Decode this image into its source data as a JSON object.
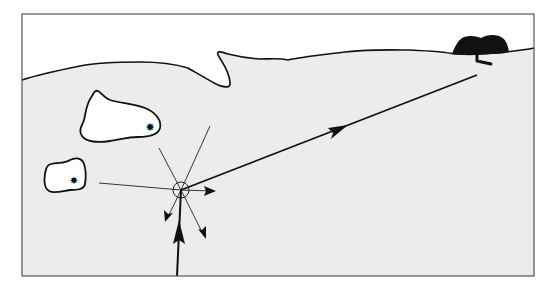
{
  "diagram": {
    "type": "schematic map",
    "colors": {
      "sea": "#ececec",
      "land": "#ffffff",
      "outline": "#111111",
      "frame": "#555555",
      "landmark": "#111111"
    },
    "elements": [
      {
        "id": "frame",
        "label": "map frame"
      },
      {
        "id": "coastline",
        "label": "coastline"
      },
      {
        "id": "island-large",
        "label": "large island",
        "marker": "star"
      },
      {
        "id": "island-small",
        "label": "small island",
        "marker": "star"
      },
      {
        "id": "origin",
        "label": "circled origin point"
      },
      {
        "id": "approach-path",
        "label": "incoming path arrow (bold, from bottom)"
      },
      {
        "id": "search-rays",
        "label": "radiating direction rays (thin)"
      },
      {
        "id": "route",
        "label": "bold route to landmark with arrowhead"
      },
      {
        "id": "landmark",
        "label": "dark landmark on shore"
      }
    ]
  }
}
